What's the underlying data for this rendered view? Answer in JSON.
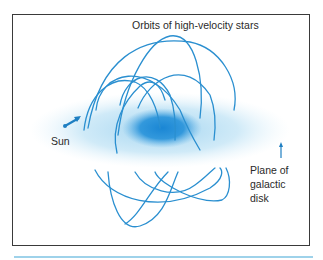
{
  "figure": {
    "title": "Orbits of high-velocity stars",
    "labels": {
      "sun": "Sun",
      "plane_line1": "Plane of",
      "plane_line2": "galactic",
      "plane_line3": "disk"
    },
    "icons": [
      "sun-position-arrow-icon",
      "plane-arrow-icon"
    ],
    "colors": {
      "orbit": "#2a8fd0",
      "bulge": "#1f8ad6",
      "disk_haze": "#bfe3f5",
      "frame": "#3a3a3a",
      "rule": "#9ed2ea"
    }
  }
}
